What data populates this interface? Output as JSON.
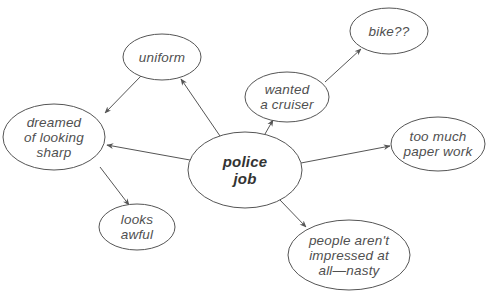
{
  "diagram": {
    "type": "mind-map",
    "colors": {
      "stroke": "#555555",
      "text": "#505050",
      "central_text": "#333333",
      "background": "#ffffff"
    },
    "central_node": {
      "id": "police-job",
      "lines": [
        "police",
        "job"
      ]
    },
    "nodes": [
      {
        "id": "uniform",
        "lines": [
          "uniform"
        ]
      },
      {
        "id": "bike",
        "lines": [
          "bike??"
        ]
      },
      {
        "id": "wanted-cruiser",
        "lines": [
          "wanted",
          "a cruiser"
        ]
      },
      {
        "id": "dreamed-sharp",
        "lines": [
          "dreamed",
          "of looking",
          "sharp"
        ]
      },
      {
        "id": "police-job",
        "lines": [
          "police",
          "job"
        ]
      },
      {
        "id": "paper-work",
        "lines": [
          "too much",
          "paper work"
        ]
      },
      {
        "id": "looks-awful",
        "lines": [
          "looks",
          "awful"
        ]
      },
      {
        "id": "people-nasty",
        "lines": [
          "people aren't",
          "impressed at",
          "all—nasty"
        ]
      }
    ],
    "edges": [
      {
        "from": "police-job",
        "to": "uniform"
      },
      {
        "from": "police-job",
        "to": "dreamed-sharp"
      },
      {
        "from": "police-job",
        "to": "wanted-cruiser"
      },
      {
        "from": "police-job",
        "to": "paper-work"
      },
      {
        "from": "police-job",
        "to": "people-nasty"
      },
      {
        "from": "uniform",
        "to": "dreamed-sharp"
      },
      {
        "from": "wanted-cruiser",
        "to": "bike"
      },
      {
        "from": "dreamed-sharp",
        "to": "looks-awful"
      }
    ]
  }
}
